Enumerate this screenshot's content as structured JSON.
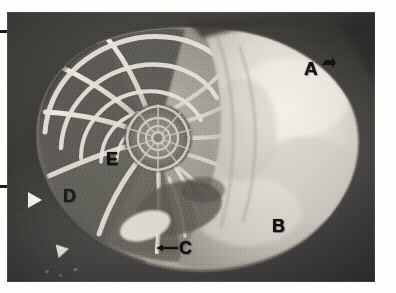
{
  "figure": {
    "domain_kind": "grayscale-photomicrograph",
    "caption": "",
    "frame": {
      "photo_left": 7,
      "photo_top": 12,
      "photo_width": 368,
      "photo_height": 270,
      "background_color": "#fdfdfc",
      "photo_field_color": "#3e3d3a",
      "shell_highlight_color": "#e8e5dd",
      "label_color": "#111110",
      "arrow_color": "#f4f3ef"
    }
  },
  "labels": [
    {
      "id": "A",
      "text": "A",
      "note": "outer body chamber / living chamber, upper right",
      "has_leader": true,
      "leader_kind": "arrow-glyph"
    },
    {
      "id": "B",
      "text": "B",
      "note": "body chamber interior, lower right",
      "has_leader": false,
      "leader_kind": ""
    },
    {
      "id": "C",
      "text": "C",
      "note": "siphuncle region, bottom centre",
      "has_leader": true,
      "leader_kind": "arrow-left"
    },
    {
      "id": "D",
      "text": "D",
      "note": "outer septa / chamber walls, left",
      "has_leader": false,
      "leader_kind": ""
    },
    {
      "id": "E",
      "text": "E",
      "note": "inner septa near spiral, centre left",
      "has_leader": false,
      "leader_kind": ""
    }
  ],
  "pointers": [
    {
      "id": "white-arrow-upper",
      "kind": "white-arrowhead",
      "direction": "right",
      "note": "points at shell left flank"
    },
    {
      "id": "white-arrow-lower",
      "kind": "white-arrowhead",
      "direction": "right",
      "note": "points at lower shell margin"
    }
  ],
  "margin_marks": [
    {
      "id": "margin-tick-top",
      "kind": "page-edge-tick"
    },
    {
      "id": "margin-tick-mid",
      "kind": "page-edge-tick"
    }
  ]
}
